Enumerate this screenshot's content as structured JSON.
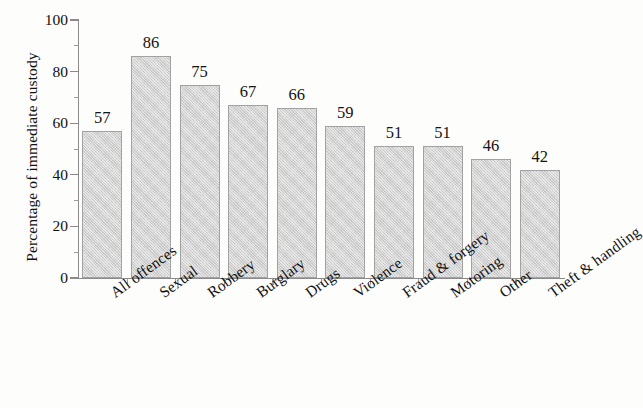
{
  "chart_data": {
    "type": "bar",
    "title": "",
    "subtitle": "",
    "xlabel": "",
    "ylabel": "Percentage of immediate custody",
    "categories": [
      "All offences",
      "Sexual",
      "Robbery",
      "Burglary",
      "Drugs",
      "Violence",
      "Fraud & forgery",
      "Motoring",
      "Other",
      "Theft & handling"
    ],
    "values": [
      57,
      86,
      75,
      67,
      66,
      59,
      51,
      51,
      46,
      42
    ],
    "data_labels": [
      "57",
      "86",
      "75",
      "67",
      "66",
      "59",
      "51",
      "51",
      "46",
      "42"
    ],
    "ylim": [
      0,
      100
    ],
    "ytick_labels": [
      "0",
      "20",
      "40",
      "60",
      "80",
      "100"
    ],
    "ytick_values": [
      0,
      20,
      40,
      60,
      80,
      100
    ],
    "y_minor_ticks": [
      10,
      30,
      50,
      70,
      90
    ],
    "grid": false,
    "legend": null,
    "legend_position": "none",
    "bar_fill_color": "#d2d2d2",
    "bar_border_color": "#a2a2a2",
    "axis_color": "#8a8a8a",
    "text_color": "#121212",
    "background_color": "#fdfdfc",
    "x_label_rotation_deg": -36,
    "annotations": []
  }
}
